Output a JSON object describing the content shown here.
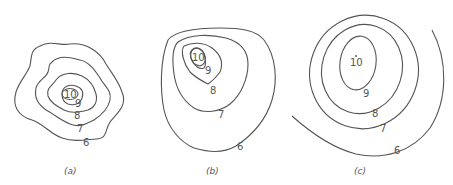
{
  "figure": {
    "panels": [
      {
        "id": "a",
        "caption": "(a)",
        "labels": [
          "10",
          "9",
          "8",
          "7",
          "6"
        ]
      },
      {
        "id": "b",
        "caption": "(b)",
        "labels": [
          "10",
          "9",
          "8",
          "7",
          "6"
        ]
      },
      {
        "id": "c",
        "caption": "(c)",
        "labels": [
          "10",
          "9",
          "8",
          "7",
          "6"
        ]
      }
    ],
    "colors": {
      "line": "#555555",
      "background": "#ffffff"
    }
  }
}
